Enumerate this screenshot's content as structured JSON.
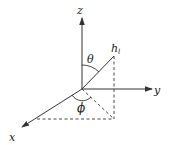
{
  "diagram": {
    "type": "3d-coordinate-system",
    "colors": {
      "stroke": "#333333",
      "text": "#222222",
      "background": "#ffffff"
    },
    "axes": {
      "z": {
        "label": "z"
      },
      "y": {
        "label": "y"
      },
      "x": {
        "label": "x"
      }
    },
    "vector": {
      "label_main": "h",
      "label_sub": "l"
    },
    "angles": {
      "polar": {
        "label": "θ",
        "description": "angle between z-axis and vector h_l"
      },
      "azimuth": {
        "label": "ϕ",
        "description": "angle between x-axis and projection of h_l onto xy-plane"
      }
    }
  }
}
